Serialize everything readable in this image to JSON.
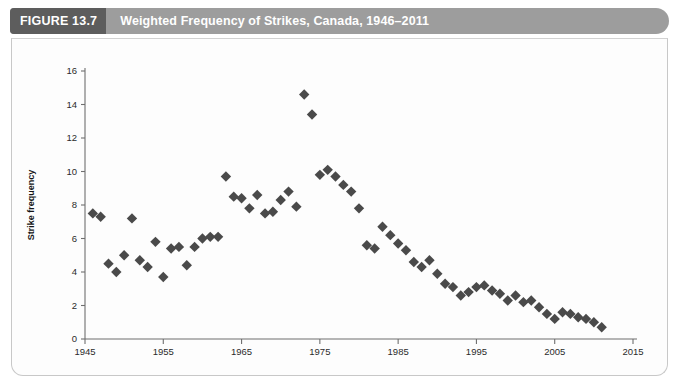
{
  "header": {
    "figure_tag": "FIGURE 13.7",
    "title": "Weighted Frequency of Strikes, Canada, 1946–2011",
    "band_color": "#9d9d9d",
    "tag_color": "#5d5d5d",
    "text_color": "#ffffff"
  },
  "chart_data": {
    "type": "scatter",
    "title": "Weighted Frequency of Strikes, Canada, 1946–2011",
    "xlabel": "",
    "ylabel": "Strike frequency",
    "xlim": [
      1945,
      2015
    ],
    "ylim": [
      0,
      16
    ],
    "xticks": [
      1945,
      1955,
      1965,
      1975,
      1985,
      1995,
      2005,
      2015
    ],
    "xtick_labels": [
      "1945",
      "1955",
      "1965",
      "1975",
      "1985",
      "1995",
      "2005",
      "2015"
    ],
    "yticks": [
      0,
      2,
      4,
      6,
      8,
      10,
      12,
      14,
      16
    ],
    "ytick_labels": [
      "0",
      "2",
      "4",
      "6",
      "8",
      "10",
      "12",
      "14",
      "16"
    ],
    "grid": false,
    "legend": null,
    "marker": "diamond",
    "marker_color": "#4a4a4a",
    "marker_size": 5.2,
    "x": [
      1946,
      1947,
      1948,
      1949,
      1950,
      1951,
      1952,
      1953,
      1954,
      1955,
      1956,
      1957,
      1958,
      1959,
      1960,
      1961,
      1962,
      1963,
      1964,
      1965,
      1966,
      1967,
      1968,
      1969,
      1970,
      1971,
      1972,
      1973,
      1974,
      1975,
      1976,
      1977,
      1978,
      1979,
      1980,
      1981,
      1982,
      1983,
      1984,
      1985,
      1986,
      1987,
      1988,
      1989,
      1990,
      1991,
      1992,
      1993,
      1994,
      1995,
      1996,
      1997,
      1998,
      1999,
      2000,
      2001,
      2002,
      2003,
      2004,
      2005,
      2006,
      2007,
      2008,
      2009,
      2010,
      2011
    ],
    "y": [
      7.5,
      7.3,
      4.5,
      4.0,
      5.0,
      7.2,
      4.7,
      4.3,
      5.8,
      3.7,
      5.4,
      5.5,
      4.4,
      5.5,
      6.0,
      6.1,
      6.1,
      9.7,
      8.5,
      8.4,
      7.8,
      8.6,
      7.5,
      7.6,
      8.3,
      8.8,
      7.9,
      14.6,
      13.4,
      9.8,
      10.1,
      9.7,
      9.2,
      8.8,
      7.8,
      5.6,
      5.4,
      6.7,
      6.2,
      5.7,
      5.3,
      4.6,
      4.3,
      4.7,
      3.9,
      3.3,
      3.1,
      2.6,
      2.8,
      3.1,
      3.2,
      2.9,
      2.7,
      2.3,
      2.6,
      2.2,
      2.3,
      1.9,
      1.5,
      1.2,
      1.6,
      1.5,
      1.3,
      1.2,
      1.0,
      0.7
    ]
  }
}
